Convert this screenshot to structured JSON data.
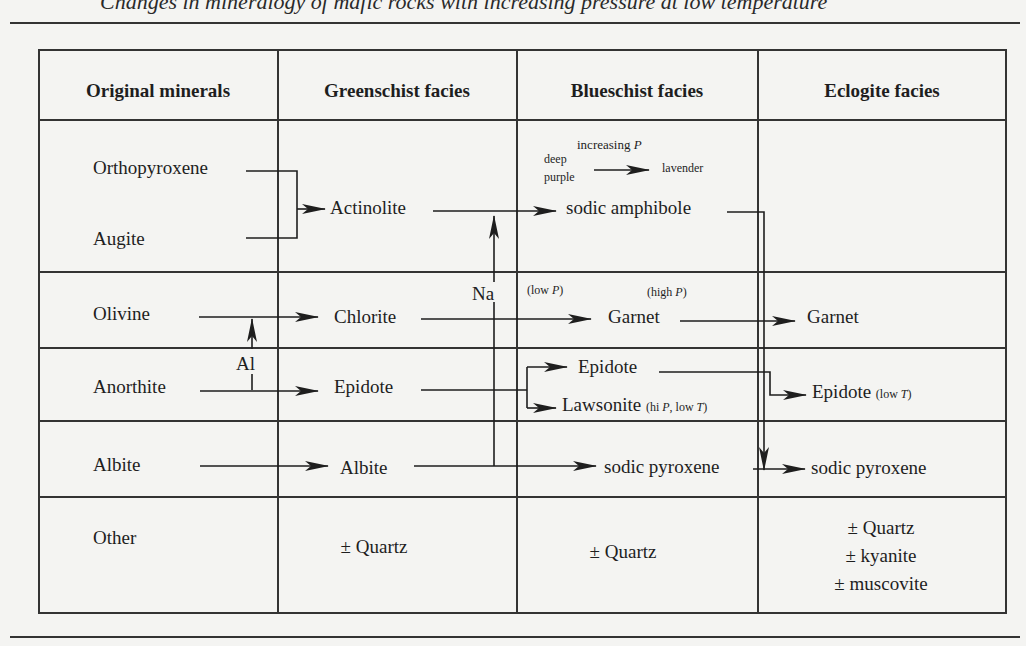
{
  "caption": "Changes in mineralogy of mafic rocks with increasing pressure at low temperature",
  "headers": [
    "Original minerals",
    "Greenschist facies",
    "Blueschist facies",
    "Eclogite facies"
  ],
  "rows": {
    "pyroxene": {
      "original": [
        "Orthopyroxene",
        "Augite"
      ],
      "greenschist": "Actinolite",
      "blueschist": "sodic amphibole",
      "color_note": {
        "label": "increasing",
        "italic": "P",
        "from": "deep purple",
        "from_1": "deep",
        "from_2": "purple",
        "to": "lavender"
      }
    },
    "olivine": {
      "original": "Olivine",
      "greenschist": "Chlorite",
      "blueschist": "Garnet",
      "eclogite": "Garnet",
      "note_low": "(low ",
      "note_low_p": "P",
      "note_high": "(high ",
      "note_high_p": "P",
      "close": ")"
    },
    "anorthite": {
      "original": "Anorthite",
      "greenschist": "Epidote",
      "blueschist": [
        "Epidote",
        "Lawsonite"
      ],
      "lawsonite_note_1": "(hi ",
      "lawsonite_note_p": "P",
      "lawsonite_note_2": ", low ",
      "lawsonite_note_t": "T",
      "eclogite": "Epidote",
      "eclogite_note_1": "(low ",
      "eclogite_note_t": "T",
      "close": ")"
    },
    "albite": {
      "original": "Albite",
      "greenschist": "Albite",
      "blueschist": "sodic pyroxene",
      "eclogite": "sodic pyroxene"
    },
    "other": {
      "original": "Other",
      "greenschist": "± Quartz",
      "blueschist": "± Quartz",
      "eclogite": [
        "± Quartz",
        "± kyanite",
        "± muscovite"
      ]
    }
  },
  "labels": {
    "al": "Al",
    "na": "Na"
  }
}
